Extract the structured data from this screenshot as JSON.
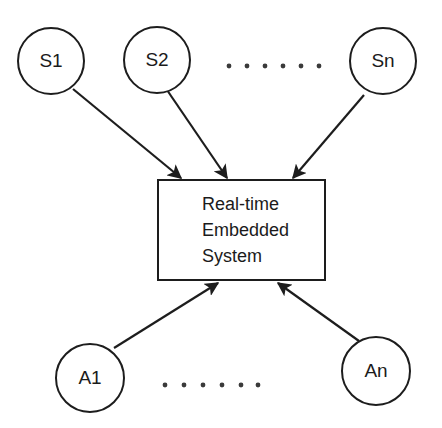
{
  "diagram": {
    "colors": {
      "stroke": "#1d1d1d",
      "text": "#1b1b1b",
      "background": "#ffffff",
      "dot": "#3a3a3a"
    },
    "center_box": {
      "name": "real-time-embedded-system",
      "lines": [
        "Real-time",
        "Embedded",
        "System"
      ],
      "line1": "Real-time",
      "line2": "Embedded",
      "line3": "System"
    },
    "sensors": [
      {
        "id": "s1",
        "label": "S1"
      },
      {
        "id": "s2",
        "label": "S2"
      },
      {
        "id": "sn",
        "label": "Sn"
      }
    ],
    "actuators": [
      {
        "id": "a1",
        "label": "A1"
      },
      {
        "id": "an",
        "label": "An"
      }
    ],
    "ellipsis": {
      "top": {
        "name": "sensors-ellipsis",
        "dot_count": 6
      },
      "bottom": {
        "name": "actuators-ellipsis",
        "dot_count": 6
      }
    },
    "edges": [
      {
        "from": "S1",
        "to": "Real-time Embedded System",
        "direction": "in"
      },
      {
        "from": "S2",
        "to": "Real-time Embedded System",
        "direction": "in"
      },
      {
        "from": "Sn",
        "to": "Real-time Embedded System",
        "direction": "in"
      },
      {
        "from": "A1",
        "to": "Real-time Embedded System",
        "direction": "in"
      },
      {
        "from": "An",
        "to": "Real-time Embedded System",
        "direction": "in"
      }
    ]
  }
}
